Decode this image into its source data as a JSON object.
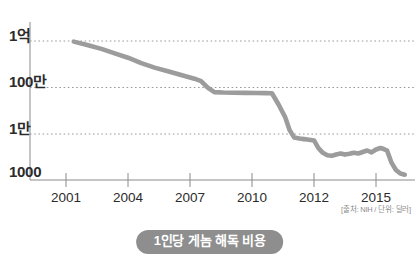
{
  "caption": "1인당 게놈 해독 비용",
  "source_note": "[출처: NIH / 단위: 달러]",
  "colors": {
    "line": "#9c9c9c",
    "grid": "#9a9a9a",
    "axis": "#8a8a8a",
    "caption_pill": "#8e8e8e",
    "caption_text": "#ffffff",
    "tick_text": "#2b2b2b",
    "source_text": "#8c8c8c",
    "background": "#ffffff"
  },
  "chart_data": {
    "type": "line",
    "title": "1인당 게놈 해독 비용",
    "subtitle": "",
    "xlabel": "",
    "ylabel": "",
    "yscale": "log",
    "ylim": [
      1000,
      100000000
    ],
    "xlim": [
      2001,
      2016.3
    ],
    "grid": true,
    "legend_position": "none",
    "ytick_labels": [
      "1억",
      "100만",
      "1만",
      "1000"
    ],
    "ytick_values": [
      100000000,
      1000000,
      10000,
      1000
    ],
    "xtick_labels": [
      "2001",
      "2004",
      "2007",
      "2010",
      "2012",
      "2015"
    ],
    "xtick_values": [
      2001,
      2004,
      2007,
      2010,
      2012,
      2015
    ],
    "series": [
      {
        "name": "1인당 게놈 해독 비용",
        "x": [
          2001.35,
          2002.0,
          2002.6,
          2003.2,
          2003.8,
          2004.4,
          2005.0,
          2005.6,
          2006.0,
          2006.4,
          2006.8,
          2007.1,
          2007.4,
          2007.7,
          2008.1,
          2008.6,
          2009.1,
          2009.6,
          2010.0,
          2010.3,
          2010.6,
          2010.9,
          2011.1,
          2011.3,
          2011.55,
          2011.75,
          2011.9,
          2012.05,
          2012.2,
          2012.4,
          2012.6,
          2012.8,
          2013.0,
          2013.2,
          2013.4,
          2013.6,
          2013.8,
          2014.0,
          2014.2,
          2014.4,
          2014.6,
          2014.8,
          2015.0,
          2015.2,
          2015.35,
          2015.5,
          2015.7,
          2015.9,
          2016.1,
          2016.3
        ],
        "y": [
          95000000,
          70000000,
          52000000,
          36000000,
          25000000,
          16000000,
          11000000,
          8200000,
          6600000,
          5400000,
          4400000,
          3600000,
          2100000,
          1450000,
          1400000,
          1380000,
          1360000,
          1340000,
          1330000,
          1320000,
          520000,
          180000,
          62000,
          34000,
          31000,
          29500,
          28500,
          27500,
          26500,
          14000,
          9500,
          7800,
          7400,
          8300,
          9000,
          8200,
          8800,
          9600,
          9000,
          10200,
          11500,
          9800,
          12500,
          14200,
          13000,
          11500,
          4200,
          2300,
          1700,
          1550
        ]
      }
    ],
    "annotations": []
  }
}
